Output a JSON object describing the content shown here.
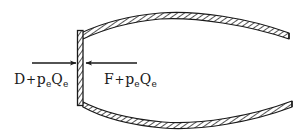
{
  "figure": {
    "style": "hand-drawn engineering line sketch, hatched shell walls",
    "background_color": "#ffffff",
    "ink_color": "#1a1a1a",
    "width": 303,
    "height": 136
  },
  "labels": {
    "left": {
      "name": "drag-plus-exit-pressure-term",
      "full_text": "D + p e Q e",
      "symbol": "D",
      "operator": "+",
      "term_symbol": "p",
      "term_subscript": "e",
      "second_symbol": "Q",
      "second_subscript": "e"
    },
    "right": {
      "name": "thrust-plus-exit-pressure-term",
      "full_text": "F + p e Q e",
      "symbol": "F",
      "operator": "+",
      "term_symbol": "p",
      "term_subscript": "e",
      "second_symbol": "Q",
      "second_subscript": "e"
    }
  },
  "arrows": {
    "left_arrow": {
      "name": "left-force-arrow",
      "direction": "right",
      "description": "horizontal arrow pointing right toward the closure wall"
    },
    "right_arrow": {
      "name": "right-force-arrow",
      "direction": "left",
      "description": "horizontal arrow pointing left toward the closure wall"
    }
  },
  "geometry": {
    "closure_wall": {
      "name": "vertical-closure-wall",
      "hatched": true,
      "orientation": "vertical"
    },
    "upper_shell": {
      "name": "upper-shell-wall",
      "hatched": true,
      "curvature": "convex-upward"
    },
    "lower_shell": {
      "name": "lower-shell-wall",
      "hatched": true,
      "curvature": "convex-downward"
    },
    "open_end": {
      "name": "open-right-end",
      "description": "shell walls terminate unclosed at the right edge"
    }
  }
}
